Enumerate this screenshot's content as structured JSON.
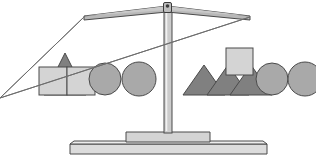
{
  "figure": {
    "name": "balance-scale",
    "title": "Balance scale with geometric shapes on two pans",
    "width": 316,
    "height": 158,
    "background": "#ffffff",
    "state": "balanced",
    "state_label": "Balanced"
  },
  "palette": {
    "outline": "#4a4a4a",
    "light_fill": "#d4d4d4",
    "mid_fill": "#a9a9a9",
    "dark_fill": "#808080",
    "beam_fill": "#b8b8b8",
    "pan_fill": "#e2e2e2",
    "post_fill": "#cccccc",
    "base_fill": "#dcdcdc",
    "string": "#6e6e6e"
  },
  "frame": {
    "beam": {
      "label": "Beam",
      "left_tip_x": 84,
      "right_tip_x": 250,
      "pivot_x": 167,
      "top_y": 6,
      "tip_y": 16
    },
    "pivot_cap": {
      "label": "Pivot cap",
      "x": 164,
      "y": 3,
      "w": 7,
      "h": 9
    },
    "post": {
      "label": "Center post",
      "x": 164,
      "y": 8,
      "w": 8,
      "h": 127
    },
    "foot": {
      "label": "Foot block",
      "x": 126,
      "y": 133,
      "w": 84,
      "h": 12
    },
    "base": {
      "label": "Base plate",
      "x": 70,
      "y": 144,
      "w": 197,
      "h": 10
    }
  },
  "pans": [
    {
      "id": "left-pan",
      "label": "Left pan",
      "center_x": 84,
      "pan_top_y": 95,
      "pan_half_width": 66,
      "pan_thickness": 11,
      "rim_inset": 8,
      "string_top_x": 84,
      "string_top_y": 16,
      "total_items": 5
    },
    {
      "id": "right-pan",
      "label": "Right pan",
      "center_x": 250,
      "pan_top_y": 95,
      "pan_half_width": 66,
      "pan_thickness": 11,
      "rim_inset": 8,
      "string_top_x": 250,
      "string_top_y": 16,
      "total_items": 6
    }
  ],
  "left_pan_items": [
    {
      "shape": "triangle",
      "label": "Dark triangle",
      "fill": "#808080",
      "cx": 65,
      "base_y": 95,
      "half_base": 21,
      "height": 42
    },
    {
      "shape": "square",
      "label": "Light square large",
      "fill": "#d4d4d4",
      "x": 39,
      "y": 67,
      "size": 28
    },
    {
      "shape": "square",
      "label": "Light square right",
      "fill": "#d4d4d4",
      "x": 67,
      "y": 67,
      "size": 28
    },
    {
      "shape": "circle",
      "label": "Grey circle one",
      "fill": "#a9a9a9",
      "cx": 105,
      "cy": 79,
      "r": 16
    },
    {
      "shape": "circle",
      "label": "Grey circle two",
      "fill": "#a9a9a9",
      "cx": 139,
      "cy": 79,
      "r": 17
    }
  ],
  "right_pan_items": [
    {
      "shape": "triangle",
      "label": "Dark triangle one",
      "fill": "#808080",
      "cx": 204,
      "base_y": 95,
      "half_base": 21,
      "height": 30
    },
    {
      "shape": "triangle",
      "label": "Dark triangle two",
      "fill": "#808080",
      "cx": 228,
      "base_y": 95,
      "half_base": 21,
      "height": 30
    },
    {
      "shape": "triangle",
      "label": "Dark triangle three",
      "fill": "#808080",
      "cx": 251,
      "base_y": 95,
      "half_base": 21,
      "height": 30
    },
    {
      "shape": "square",
      "label": "Light square on triangle",
      "fill": "#d4d4d4",
      "x": 226,
      "y": 48,
      "size": 27
    },
    {
      "shape": "circle",
      "label": "Grey circle one",
      "fill": "#a9a9a9",
      "cx": 272,
      "cy": 79,
      "r": 16
    },
    {
      "shape": "circle",
      "label": "Grey circle two",
      "fill": "#a9a9a9",
      "cx": 305,
      "cy": 79,
      "r": 17
    }
  ],
  "legend": {
    "triangle_label": "Triangle",
    "square_label": "Square",
    "circle_label": "Circle"
  }
}
